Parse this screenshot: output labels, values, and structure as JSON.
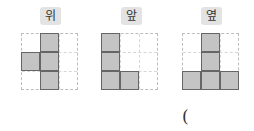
{
  "views": [
    {
      "label": "위",
      "meaning": "top view",
      "cells": [
        [
          0,
          1
        ],
        [
          1,
          0
        ],
        [
          1,
          1
        ],
        [
          2,
          1
        ]
      ]
    },
    {
      "label": "앞",
      "meaning": "front view",
      "cells": [
        [
          0,
          0
        ],
        [
          1,
          0
        ],
        [
          2,
          0
        ],
        [
          2,
          1
        ]
      ]
    },
    {
      "label": "옆",
      "meaning": "side view",
      "cells": [
        [
          0,
          1
        ],
        [
          1,
          1
        ],
        [
          2,
          0
        ],
        [
          2,
          1
        ],
        [
          2,
          2
        ]
      ]
    }
  ],
  "grid_size": 3,
  "colors": {
    "cell_fill": "#c4c4c4",
    "cell_border": "#666666",
    "badge": "#e3e3e3",
    "grid_dash": "#bdbdbd"
  },
  "answer_paren": "("
}
